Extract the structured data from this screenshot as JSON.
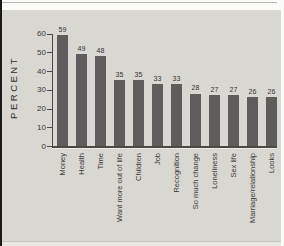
{
  "chart_data": {
    "type": "bar",
    "title": "",
    "ylabel": "PERCENT",
    "categories": [
      "Money",
      "Health",
      "Time",
      "Want more out of life",
      "Children",
      "Job",
      "Recognition",
      "So much change",
      "Loneliness",
      "Sex life",
      "Marriage/relationship",
      "Looks"
    ],
    "values": [
      59,
      49,
      48,
      35,
      35,
      33,
      33,
      28,
      27,
      27,
      26,
      26
    ],
    "yticks": [
      0,
      10,
      20,
      30,
      40,
      50,
      60
    ],
    "ylim": [
      0,
      60
    ],
    "grid": false,
    "legend": false,
    "value_labels": true,
    "bar_color": "#5e5d5b",
    "panel_bg": "#d8d7d2",
    "axis_color": "#4a4a48",
    "text_color": "#3a3a38"
  }
}
